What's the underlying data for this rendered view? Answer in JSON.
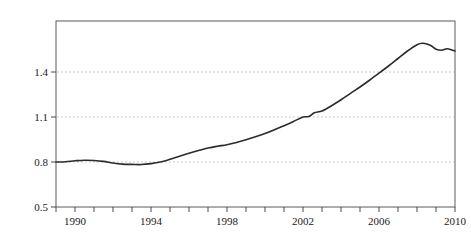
{
  "chart_data": {
    "type": "line",
    "title": "",
    "subtitle": "",
    "xlabel": "",
    "ylabel": "比重",
    "ylabel_chars": [
      "比",
      "重"
    ],
    "xlim": [
      1989,
      2010
    ],
    "ylim": [
      0.5,
      1.6
    ],
    "yticks": [
      0.5,
      0.8,
      1.1,
      1.4
    ],
    "ytick_labels": [
      "0.5",
      "0.8",
      "1.1",
      "1.4"
    ],
    "xticks": [
      1989,
      1990,
      1991,
      1992,
      1993,
      1994,
      1995,
      1996,
      1997,
      1998,
      1999,
      2000,
      2001,
      2002,
      2003,
      2004,
      2005,
      2006,
      2007,
      2008,
      2009,
      2010
    ],
    "xtick_labels": [
      "",
      "1990",
      "",
      "",
      "",
      "1994",
      "",
      "",
      "",
      "1998",
      "",
      "",
      "",
      "2002",
      "",
      "",
      "",
      "2006",
      "",
      "",
      "",
      "2010"
    ],
    "xtick_labeled_values": [
      1990,
      1994,
      1998,
      2002,
      2006,
      2010
    ],
    "grid": true,
    "grid_axis": "y",
    "grid_style": "dotted",
    "legend": null,
    "legend_position": "none",
    "series": [
      {
        "name": "比重",
        "color": "#2b2b2b",
        "x": [
          1989.0,
          1989.5,
          1990.0,
          1990.5,
          1991.0,
          1991.5,
          1992.0,
          1992.5,
          1993.0,
          1993.5,
          1994.0,
          1994.5,
          1995.0,
          1995.5,
          1996.0,
          1996.5,
          1997.0,
          1997.5,
          1998.0,
          1998.5,
          1999.0,
          1999.5,
          2000.0,
          2000.5,
          2001.0,
          2001.5,
          2002.0,
          2002.3,
          2002.6,
          2003.0,
          2003.5,
          2004.0,
          2004.5,
          2005.0,
          2005.5,
          2006.0,
          2006.5,
          2007.0,
          2007.5,
          2008.0,
          2008.3,
          2008.7,
          2009.0,
          2009.3,
          2009.6,
          2010.0
        ],
        "values": [
          0.8,
          0.802,
          0.808,
          0.812,
          0.81,
          0.804,
          0.793,
          0.786,
          0.784,
          0.783,
          0.789,
          0.8,
          0.818,
          0.838,
          0.858,
          0.876,
          0.893,
          0.905,
          0.915,
          0.93,
          0.948,
          0.968,
          0.99,
          1.015,
          1.042,
          1.07,
          1.1,
          1.103,
          1.128,
          1.14,
          1.175,
          1.215,
          1.258,
          1.3,
          1.345,
          1.392,
          1.44,
          1.49,
          1.54,
          1.582,
          1.592,
          1.578,
          1.552,
          1.545,
          1.555,
          1.54
        ]
      }
    ]
  },
  "axes": {
    "y_axis_name": "y-axis",
    "x_axis_name": "x-axis",
    "frame": "plot-frame"
  }
}
